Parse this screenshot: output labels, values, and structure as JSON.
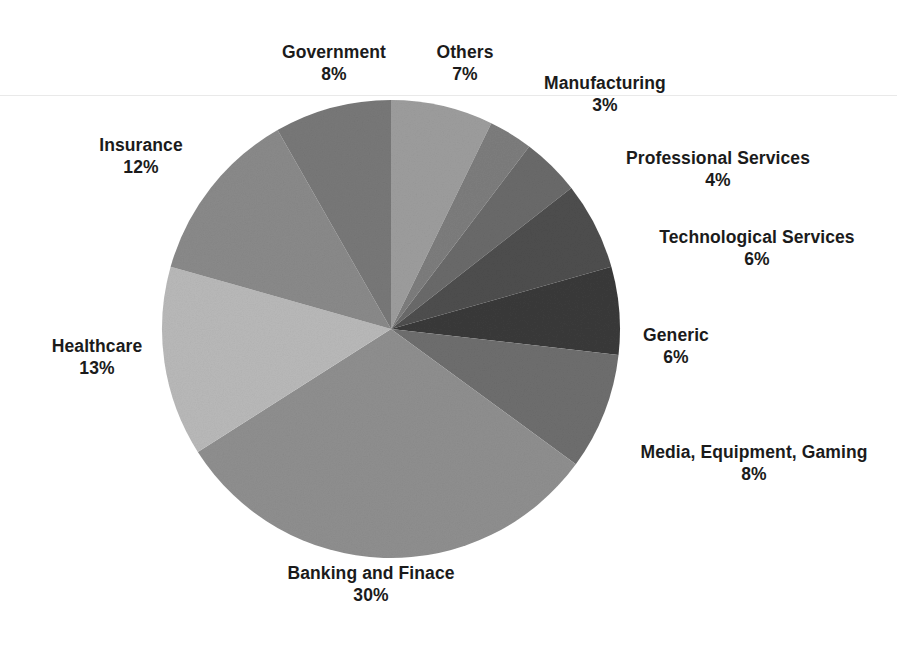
{
  "chart_data": {
    "type": "pie",
    "title": "",
    "legend": "labels-outside",
    "grid": false,
    "total_labeled_percent": 97,
    "start_angle_deg": 0,
    "direction": "clockwise",
    "categories": [
      "Others",
      "Manufacturing",
      "Professional Services",
      "Technological Services",
      "Generic",
      "Media, Equipment, Gaming",
      "Banking and Finace",
      "Healthcare",
      "Insurance",
      "Government"
    ],
    "values": [
      7,
      3,
      4,
      6,
      6,
      8,
      30,
      13,
      12,
      8
    ],
    "value_labels": [
      "7%",
      "3%",
      "4%",
      "6%",
      "6%",
      "8%",
      "30%",
      "13%",
      "12%",
      "8%"
    ],
    "slice_colors": [
      "#9d9d9d",
      "#7d7d7d",
      "#6a6a6a",
      "#4e4e4e",
      "#3a3a3a",
      "#6e6e6e",
      "#8f8f8f",
      "#b9b9b9",
      "#8a8a8a",
      "#787878"
    ],
    "slices": [
      {
        "label": "Others",
        "value": 7,
        "value_label": "7%",
        "color": "#9d9d9d"
      },
      {
        "label": "Manufacturing",
        "value": 3,
        "value_label": "3%",
        "color": "#7d7d7d"
      },
      {
        "label": "Professional Services",
        "value": 4,
        "value_label": "4%",
        "color": "#6a6a6a"
      },
      {
        "label": "Technological Services",
        "value": 6,
        "value_label": "6%",
        "color": "#4e4e4e"
      },
      {
        "label": "Generic",
        "value": 6,
        "value_label": "6%",
        "color": "#3a3a3a"
      },
      {
        "label": "Media, Equipment, Gaming",
        "value": 8,
        "value_label": "8%",
        "color": "#6e6e6e"
      },
      {
        "label": "Banking and Finace",
        "value": 30,
        "value_label": "30%",
        "color": "#8f8f8f"
      },
      {
        "label": "Healthcare",
        "value": 13,
        "value_label": "13%",
        "color": "#b9b9b9"
      },
      {
        "label": "Insurance",
        "value": 12,
        "value_label": "12%",
        "color": "#8a8a8a"
      },
      {
        "label": "Government",
        "value": 8,
        "value_label": "8%",
        "color": "#787878"
      }
    ],
    "geometry": {
      "center_x": 391,
      "center_y": 329,
      "radius": 229
    }
  },
  "labels": {
    "government": {
      "name": "Government",
      "value": "8%"
    },
    "others": {
      "name": "Others",
      "value": "7%"
    },
    "manufacturing": {
      "name": "Manufacturing",
      "value": "3%"
    },
    "professional": {
      "name": "Professional Services",
      "value": "4%"
    },
    "technological": {
      "name": "Technological Services",
      "value": "6%"
    },
    "generic": {
      "name": "Generic",
      "value": "6%"
    },
    "media": {
      "name": "Media, Equipment, Gaming",
      "value": "8%"
    },
    "banking": {
      "name": "Banking and Finace",
      "value": "30%"
    },
    "healthcare": {
      "name": "Healthcare",
      "value": "13%"
    },
    "insurance": {
      "name": "Insurance",
      "value": "12%"
    }
  }
}
